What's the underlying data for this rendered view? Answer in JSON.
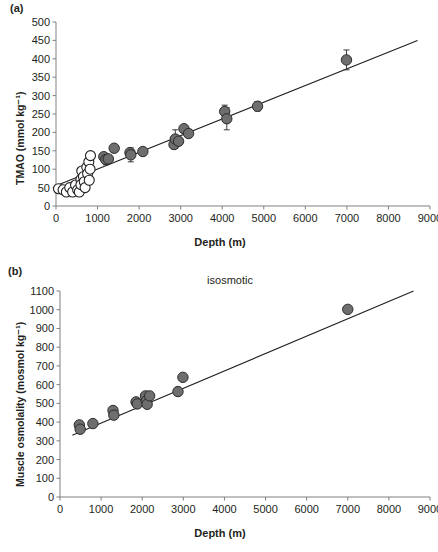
{
  "figure": {
    "panel_a_label": "(a)",
    "panel_b_label": "(b)"
  },
  "chart_data": [
    {
      "type": "scatter",
      "panel": "(a)",
      "title": "",
      "xlabel": "Depth (m)",
      "ylabel": "TMAO (mmol kg⁻¹)",
      "xlim": [
        0,
        9000
      ],
      "ylim": [
        0,
        500
      ],
      "xticks": [
        0,
        1000,
        2000,
        3000,
        4000,
        5000,
        6000,
        7000,
        8000,
        9000
      ],
      "yticks": [
        0,
        50,
        100,
        150,
        200,
        250,
        300,
        350,
        400,
        450,
        500
      ],
      "grid": false,
      "legend": "none",
      "series": [
        {
          "name": "shallow-species-open-circles",
          "marker": "open-circle",
          "points": [
            {
              "x": 60,
              "y": 47
            },
            {
              "x": 170,
              "y": 44
            },
            {
              "x": 250,
              "y": 38
            },
            {
              "x": 330,
              "y": 50
            },
            {
              "x": 400,
              "y": 38
            },
            {
              "x": 470,
              "y": 57
            },
            {
              "x": 520,
              "y": 44
            },
            {
              "x": 560,
              "y": 38
            },
            {
              "x": 600,
              "y": 72
            },
            {
              "x": 600,
              "y": 58
            },
            {
              "x": 620,
              "y": 95
            },
            {
              "x": 660,
              "y": 80
            },
            {
              "x": 680,
              "y": 66
            },
            {
              "x": 700,
              "y": 50
            },
            {
              "x": 740,
              "y": 105
            },
            {
              "x": 760,
              "y": 88
            },
            {
              "x": 790,
              "y": 120
            },
            {
              "x": 800,
              "y": 70
            },
            {
              "x": 820,
              "y": 100
            },
            {
              "x": 830,
              "y": 137,
              "yerr": 10
            }
          ]
        },
        {
          "name": "deep-species-filled-circles",
          "marker": "filled-circle",
          "points": [
            {
              "x": 1150,
              "y": 134
            },
            {
              "x": 1200,
              "y": 126,
              "yerr": 14
            },
            {
              "x": 1260,
              "y": 128
            },
            {
              "x": 1400,
              "y": 157
            },
            {
              "x": 1780,
              "y": 145
            },
            {
              "x": 1800,
              "y": 139,
              "yerr": 19
            },
            {
              "x": 2090,
              "y": 148
            },
            {
              "x": 2840,
              "y": 167
            },
            {
              "x": 2870,
              "y": 182,
              "yerr": 25
            },
            {
              "x": 2950,
              "y": 176
            },
            {
              "x": 3080,
              "y": 210
            },
            {
              "x": 3190,
              "y": 197
            },
            {
              "x": 4060,
              "y": 257,
              "yerr": 17
            },
            {
              "x": 4110,
              "y": 237,
              "yerr": 30
            },
            {
              "x": 4850,
              "y": 271,
              "yerr": 13
            },
            {
              "x": 6990,
              "y": 397,
              "yerr": 27
            }
          ]
        }
      ],
      "fit_line": {
        "x0": 0,
        "y0": 55,
        "x1": 8700,
        "y1": 450
      }
    },
    {
      "type": "scatter",
      "panel": "(b)",
      "title": "isosmotic",
      "xlabel": "Depth (m)",
      "ylabel": "Muscle osmolality (mosmol kg⁻¹)",
      "xlim": [
        0,
        9000
      ],
      "ylim": [
        0,
        1100
      ],
      "xticks": [
        0,
        1000,
        2000,
        3000,
        4000,
        5000,
        6000,
        7000,
        8000,
        9000
      ],
      "yticks": [
        0,
        100,
        200,
        300,
        400,
        500,
        600,
        700,
        800,
        900,
        1000,
        1100
      ],
      "grid": false,
      "legend": "none",
      "series": [
        {
          "name": "muscle-osmolality-filled-circles",
          "marker": "filled-circle",
          "points": [
            {
              "x": 470,
              "y": 385
            },
            {
              "x": 490,
              "y": 362
            },
            {
              "x": 800,
              "y": 392
            },
            {
              "x": 1290,
              "y": 462
            },
            {
              "x": 1310,
              "y": 437
            },
            {
              "x": 1850,
              "y": 508
            },
            {
              "x": 1880,
              "y": 497
            },
            {
              "x": 2080,
              "y": 540
            },
            {
              "x": 2100,
              "y": 513
            },
            {
              "x": 2120,
              "y": 495
            },
            {
              "x": 2180,
              "y": 540
            },
            {
              "x": 2870,
              "y": 563
            },
            {
              "x": 2990,
              "y": 639
            },
            {
              "x": 7000,
              "y": 1002
            }
          ]
        }
      ],
      "fit_line": {
        "x0": 300,
        "y0": 330,
        "x1": 8600,
        "y1": 1100
      }
    }
  ]
}
